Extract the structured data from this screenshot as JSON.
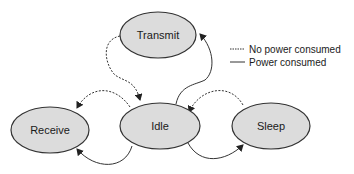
{
  "diagram": {
    "type": "state-transition",
    "states": [
      {
        "id": "transmit",
        "label": "Transmit"
      },
      {
        "id": "idle",
        "label": "Idle"
      },
      {
        "id": "receive",
        "label": "Receive"
      },
      {
        "id": "sleep",
        "label": "Sleep"
      }
    ],
    "transitions": [
      {
        "from": "transmit",
        "to": "idle",
        "style": "dashed"
      },
      {
        "from": "idle",
        "to": "transmit",
        "style": "solid"
      },
      {
        "from": "idle",
        "to": "receive",
        "style": "dashed"
      },
      {
        "from": "idle",
        "to": "receive",
        "style": "solid"
      },
      {
        "from": "sleep",
        "to": "idle",
        "style": "dashed"
      },
      {
        "from": "idle",
        "to": "sleep",
        "style": "solid"
      }
    ],
    "legend": {
      "dashed_label": "No power consumed",
      "solid_label": "Power consumed"
    },
    "colors": {
      "node_fill": "#dcdcdc",
      "stroke": "#333333"
    }
  }
}
